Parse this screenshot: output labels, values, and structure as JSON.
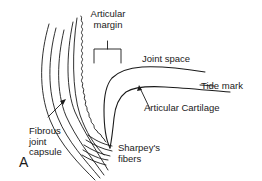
{
  "figure": {
    "letter": "A",
    "labels": {
      "articular_margin_line1": "Articular",
      "articular_margin_line2": "margin",
      "joint_space": "Joint space",
      "tide_mark": "Tide mark",
      "articular_cartilage": "Articular Cartilage",
      "fibrous_joint_capsule_line1": "Fibrous",
      "fibrous_joint_capsule_line2": "joint",
      "fibrous_joint_capsule_line3": "capsule",
      "sharpeys_fibers_line1": "Sharpey's",
      "sharpeys_fibers_line2": "fibers"
    },
    "colors": {
      "line": "#1a1a1a",
      "background": "#ffffff"
    }
  }
}
